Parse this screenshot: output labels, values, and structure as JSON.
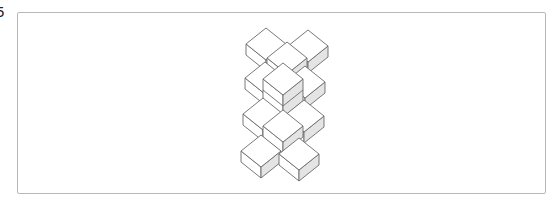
{
  "figure": {
    "label": "5",
    "colors": {
      "stroke": "#6a6a6a",
      "face_top": "#ffffff",
      "face_left": "#ffffff",
      "face_right": "#e4e4e4",
      "frame": "#b8b8b8"
    },
    "cube": {
      "half_width": 20,
      "half_height": 16,
      "thickness": 11
    },
    "cubes": [
      {
        "id": "A",
        "x": 266,
        "y": 28
      },
      {
        "id": "C",
        "x": 308,
        "y": 30
      },
      {
        "id": "B",
        "x": 287,
        "y": 42
      },
      {
        "id": "D",
        "x": 265,
        "y": 62
      },
      {
        "id": "F",
        "x": 305,
        "y": 66
      },
      {
        "id": "E",
        "x": 283,
        "y": 63,
        "stack": 2
      },
      {
        "id": "G",
        "x": 263,
        "y": 98
      },
      {
        "id": "I",
        "x": 304,
        "y": 100
      },
      {
        "id": "H",
        "x": 283,
        "y": 110
      },
      {
        "id": "J",
        "x": 261,
        "y": 135
      },
      {
        "id": "K",
        "x": 299,
        "y": 138
      }
    ]
  }
}
